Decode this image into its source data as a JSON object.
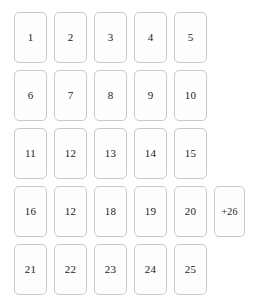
{
  "grid": {
    "columns": 5,
    "rows": [
      {
        "row_index": 1,
        "cards": [
          {
            "label": "1"
          },
          {
            "label": "2"
          },
          {
            "label": "3"
          },
          {
            "label": "4"
          },
          {
            "label": "5"
          }
        ]
      },
      {
        "row_index": 2,
        "cards": [
          {
            "label": "6"
          },
          {
            "label": "7"
          },
          {
            "label": "8"
          },
          {
            "label": "9"
          },
          {
            "label": "10"
          }
        ]
      },
      {
        "row_index": 3,
        "cards": [
          {
            "label": "11"
          },
          {
            "label": "12"
          },
          {
            "label": "13"
          },
          {
            "label": "14"
          },
          {
            "label": "15"
          }
        ]
      },
      {
        "row_index": 4,
        "cards": [
          {
            "label": "16"
          },
          {
            "label": "12"
          },
          {
            "label": "18"
          },
          {
            "label": "19"
          },
          {
            "label": "20"
          },
          {
            "label": "+26",
            "overflow": true
          }
        ]
      },
      {
        "row_index": 5,
        "cards": [
          {
            "label": "21"
          },
          {
            "label": "22"
          },
          {
            "label": "23"
          },
          {
            "label": "24"
          },
          {
            "label": "25"
          }
        ]
      }
    ]
  },
  "colors": {
    "card_border": "#c9c9c9",
    "card_background": "#fefefe",
    "page_background": "#ffffff",
    "label_text": "#1a1a1a"
  }
}
